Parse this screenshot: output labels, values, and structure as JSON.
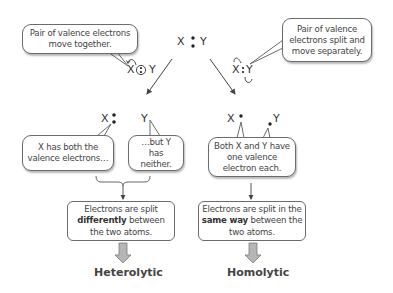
{
  "top": {
    "molecule": {
      "x": "X",
      "bond": "∶",
      "y": "Y"
    },
    "left_callout": "Pair of valence electrons move together.",
    "right_callout": "Pair of valence electrons split and move separately.",
    "left_mechanism": {
      "x": "X",
      "y": "Y"
    },
    "right_mechanism": {
      "x": "X",
      "y": "Y"
    }
  },
  "products": {
    "heterolytic": {
      "x": "X",
      "y": "Y",
      "x_callout": "X has both the valence electrons…",
      "y_callout": "…but Y has neither."
    },
    "homolytic": {
      "x": "X",
      "y": "Y",
      "callout": "Both X and Y have one valence electron each."
    }
  },
  "summary": {
    "heterolytic": {
      "text_pre": "Electrons are split",
      "text_bold": "differently",
      "text_post": "between the two atoms.",
      "label": "Heterolytic"
    },
    "homolytic": {
      "text_pre": "Electrons are split in the",
      "text_bold": "same way",
      "text_post": "between the two atoms.",
      "label": "Homolytic"
    }
  },
  "colors": {
    "line": "#555555",
    "block_arrow_fill": "#b5b5b5",
    "block_arrow_stroke": "#7a7a7a",
    "text": "#444444"
  }
}
